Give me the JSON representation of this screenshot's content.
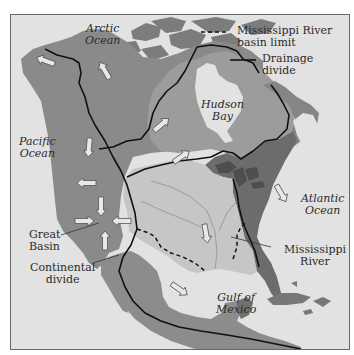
{
  "map": {
    "title": "North American drainage basins",
    "colors": {
      "ocean": "#e2e2e2",
      "land_west": "#8a8a8a",
      "land_north": "#8e8e8e",
      "hudson_basin": "#9a9a9a",
      "mississippi_basin": "#c4c4c4",
      "atlantic_basin": "#6e6e6e",
      "divide_line": "#111111",
      "frame": "#6a6a6a"
    },
    "labels": {
      "arctic_ocean": [
        "Arctic",
        "Ocean"
      ],
      "pacific_ocean": [
        "Pacific",
        "Ocean"
      ],
      "hudson_bay": [
        "Hudson",
        "Bay"
      ],
      "atlantic_ocean": [
        "Atlantic",
        "Ocean"
      ],
      "gulf_of_mexico": [
        "Gulf of",
        "Mexico"
      ],
      "great_basin": [
        "Great",
        "Basin"
      ],
      "continental_divide": [
        "Continental",
        "divide"
      ],
      "mississippi_river": [
        "Mississippi",
        "River"
      ]
    },
    "legend": {
      "items": [
        {
          "symbol": "dashed-line",
          "label_lines": [
            "Mississippi River",
            "basin limit"
          ]
        },
        {
          "symbol": "solid-line",
          "label_lines": [
            "Drainage",
            "divide"
          ]
        }
      ]
    },
    "flow_arrows": [
      {
        "x": 45,
        "y": 58,
        "angle": 200,
        "region": "Alaska"
      },
      {
        "x": 104,
        "y": 68,
        "angle": 240,
        "region": "Mackenzie"
      },
      {
        "x": 78,
        "y": 135,
        "angle": 95,
        "region": "Pacific Northwest"
      },
      {
        "x": 157,
        "y": 123,
        "angle": 50,
        "region": "Hudson Bay"
      },
      {
        "x": 78,
        "y": 180,
        "angle": 180,
        "region": "Columbia"
      },
      {
        "x": 91,
        "y": 204,
        "angle": 90,
        "region": "Great Basin north"
      },
      {
        "x": 72,
        "y": 220,
        "angle": 0,
        "region": "Great Basin west"
      },
      {
        "x": 111,
        "y": 220,
        "angle": 180,
        "region": "Great Basin east"
      },
      {
        "x": 95,
        "y": 240,
        "angle": 270,
        "region": "Great Basin south"
      },
      {
        "x": 202,
        "y": 230,
        "angle": 80,
        "region": "Mississippi"
      },
      {
        "x": 170,
        "y": 286,
        "angle": 40,
        "region": "Rio Grande"
      },
      {
        "x": 250,
        "y": 172,
        "angle": 60,
        "region": "St. Lawrence"
      }
    ]
  }
}
